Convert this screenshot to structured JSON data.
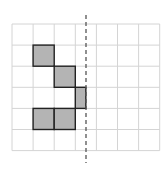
{
  "diagram": {
    "type": "grid-reflection",
    "grid": {
      "columns": 7,
      "rows": 6,
      "origin_x": 12,
      "origin_y": 24,
      "cell": 21.1
    },
    "colors": {
      "grid_line": "#d4d4d4",
      "fill": "#b4b4b4",
      "outline": "#222222",
      "axis": "#555555"
    },
    "mirror_line": {
      "x": 86,
      "y1": 15,
      "y2": 163,
      "style": "dashed"
    },
    "shaded_cells": [
      {
        "col": 1,
        "row": 1,
        "width": 1
      },
      {
        "col": 2,
        "row": 2,
        "width": 1
      },
      {
        "col": 3,
        "row": 3,
        "width": 0.5
      },
      {
        "col": 1,
        "row": 4,
        "width": 1
      },
      {
        "col": 2,
        "row": 4,
        "width": 1
      }
    ]
  }
}
